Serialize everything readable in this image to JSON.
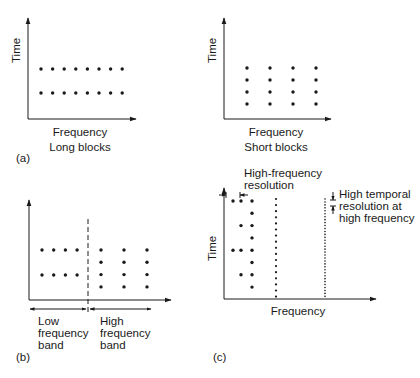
{
  "colors": {
    "ink": "#1a1a1a",
    "background": "#ffffff"
  },
  "panels": {
    "a_long": {
      "tag": "(a)",
      "ylabel": "Time",
      "xlabel": "Frequency",
      "caption": "Long blocks",
      "grid": {
        "cols": 8,
        "rows": 2
      }
    },
    "a_short": {
      "ylabel": "Time",
      "xlabel": "Frequency",
      "caption": "Short blocks",
      "grid": {
        "cols": 4,
        "rows": 4
      }
    },
    "b": {
      "tag": "(b)",
      "low_band_label": "Low\nfrequency\nband",
      "high_band_label": "High\nfrequency\nband",
      "low_grid": {
        "cols": 4,
        "rows": 2
      },
      "high_grid": {
        "cols": 3,
        "rows": 4
      }
    },
    "c": {
      "tag": "(c)",
      "ylabel": "Time",
      "xlabel": "Frequency",
      "freq_res_label": "High-frequency\nresolution",
      "temporal_res_label": "High temporal\nresolution at\nhigh frequency",
      "columns_dot_counts": [
        2,
        4,
        8,
        17,
        34
      ]
    }
  }
}
